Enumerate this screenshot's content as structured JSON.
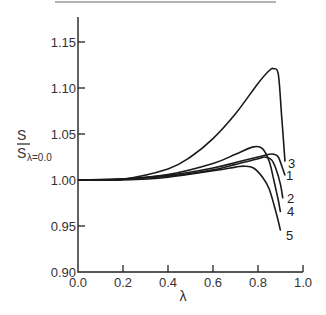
{
  "chart_data": {
    "type": "line",
    "title": "",
    "xlabel": "λ",
    "ylabel": "S / S_λ=0.0",
    "ylabel_numerator": "S",
    "ylabel_denominator": "S",
    "ylabel_subscript": "λ=0.0",
    "xlim": [
      0.0,
      1.0
    ],
    "ylim": [
      0.9,
      1.17
    ],
    "xticks": [
      "0.0",
      "0.2",
      "0.4",
      "0.6",
      "0.8",
      "1.0"
    ],
    "yticks": [
      "0.90",
      "0.95",
      "1.00",
      "1.05",
      "1.10",
      "1.15"
    ],
    "grid": false,
    "legend": "inline curve labels at right end",
    "series": [
      {
        "name": "3",
        "x": [
          0.0,
          0.2,
          0.4,
          0.5,
          0.6,
          0.7,
          0.8,
          0.85,
          0.87,
          0.89,
          0.905,
          0.92
        ],
        "y": [
          1.0,
          1.001,
          1.012,
          1.025,
          1.045,
          1.072,
          1.105,
          1.119,
          1.121,
          1.115,
          1.07,
          1.02
        ]
      },
      {
        "name": "1",
        "x": [
          0.0,
          0.2,
          0.4,
          0.6,
          0.7,
          0.8,
          0.85,
          0.87,
          0.89,
          0.91,
          0.92
        ],
        "y": [
          1.0,
          1.001,
          1.005,
          1.013,
          1.019,
          1.025,
          1.028,
          1.028,
          1.025,
          1.012,
          1.005
        ]
      },
      {
        "name": "2",
        "x": [
          0.0,
          0.2,
          0.4,
          0.6,
          0.7,
          0.8,
          0.83,
          0.86,
          0.88,
          0.9,
          0.91
        ],
        "y": [
          1.0,
          1.001,
          1.004,
          1.011,
          1.017,
          1.023,
          1.025,
          1.022,
          1.012,
          0.995,
          0.98
        ]
      },
      {
        "name": "4",
        "x": [
          0.0,
          0.2,
          0.4,
          0.6,
          0.7,
          0.78,
          0.82,
          0.85,
          0.87,
          0.89,
          0.9
        ],
        "y": [
          1.0,
          1.001,
          1.006,
          1.018,
          1.028,
          1.036,
          1.034,
          1.02,
          1.0,
          0.978,
          0.965
        ]
      },
      {
        "name": "5",
        "x": [
          0.0,
          0.2,
          0.4,
          0.6,
          0.7,
          0.74,
          0.78,
          0.82,
          0.85,
          0.88,
          0.9
        ],
        "y": [
          1.0,
          1.0,
          1.003,
          1.01,
          1.014,
          1.015,
          1.013,
          1.003,
          0.99,
          0.965,
          0.945
        ]
      }
    ]
  },
  "labels": {
    "x_axis": "λ",
    "y_num": "S",
    "y_den": "S",
    "y_sub": "λ=0.0"
  }
}
